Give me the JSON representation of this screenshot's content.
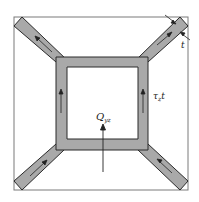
{
  "diagram": {
    "labels": {
      "shear_flow": "τ",
      "shear_flow_sub": "z",
      "thickness_suffix": "t",
      "thickness": "t",
      "shear_force": "Q",
      "shear_force_sub": "yz"
    },
    "colors": {
      "wall_fill": "#a9a9a9",
      "wall_stroke": "#2a2a2a",
      "frame": "#7a7a7a",
      "arrow": "#222222"
    }
  }
}
